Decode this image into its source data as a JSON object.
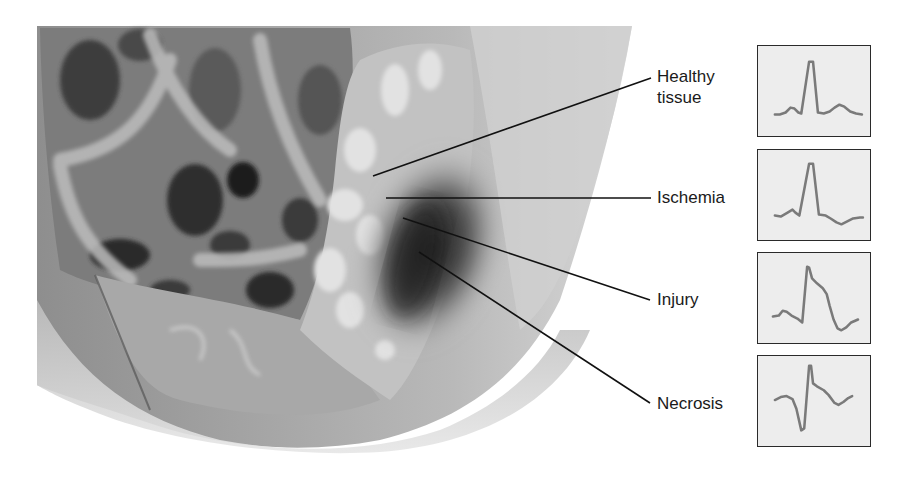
{
  "figure": {
    "labels": [
      {
        "id": "healthy",
        "lines": [
          "Healthy",
          "tissue"
        ]
      },
      {
        "id": "ischemia",
        "lines": [
          "Ischemia"
        ]
      },
      {
        "id": "injury",
        "lines": [
          "Injury"
        ]
      },
      {
        "id": "necrosis",
        "lines": [
          "Necrosis"
        ]
      }
    ],
    "ecg_panels": [
      {
        "for": "healthy",
        "description": "normal QRS, normal ST, upright T wave"
      },
      {
        "for": "ischemia",
        "description": "normal QRS, inverted T wave"
      },
      {
        "for": "injury",
        "description": "ST segment elevation"
      },
      {
        "for": "necrosis",
        "description": "deep Q wave with ST elevation"
      }
    ],
    "colors": {
      "background": "#ffffff",
      "leader_line": "#111111",
      "ecg_trace": "#7a7a7a",
      "ecg_panel_bg": "#ededed",
      "ecg_panel_border": "#2a2a2a"
    }
  }
}
